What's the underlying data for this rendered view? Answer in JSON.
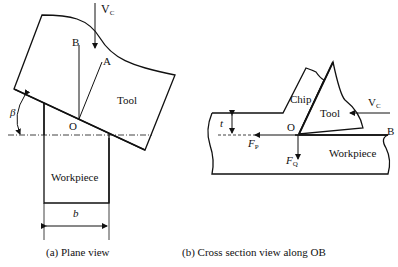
{
  "figure": {
    "panel_a": {
      "caption": "(a) Plane view",
      "labels": {
        "velocity": "V",
        "velocity_sub": "C",
        "point_b": "B",
        "point_a": "A",
        "tool": "Tool",
        "angle": "β",
        "origin": "O",
        "workpiece": "Workpiece",
        "width": "b"
      }
    },
    "panel_b": {
      "caption": "(b) Cross section view along OB",
      "labels": {
        "chip": "Chip",
        "tool": "Tool",
        "velocity": "V",
        "velocity_sub": "C",
        "thickness": "t",
        "origin": "O",
        "point_b": "B",
        "force_p": "F",
        "force_p_sub": "P",
        "force_q": "F",
        "force_q_sub": "Q",
        "workpiece": "Workpiece"
      }
    }
  }
}
